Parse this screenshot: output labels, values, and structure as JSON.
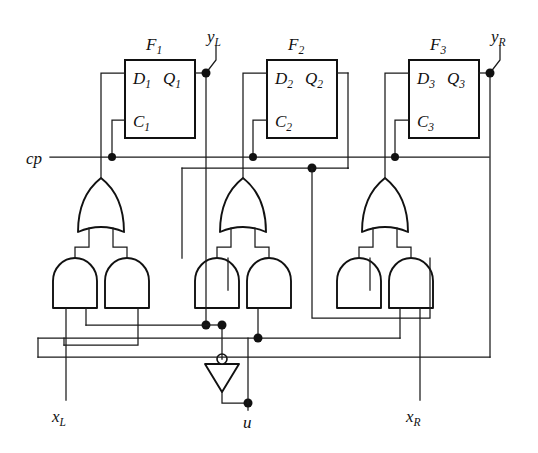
{
  "figure": {
    "type": "logic-circuit-diagram",
    "background_color": "#ffffff",
    "line_color": "#111111"
  },
  "flipflops": [
    {
      "name": "F",
      "index": "1",
      "d_label": "D",
      "d_index": "1",
      "q_label": "Q",
      "q_index": "1",
      "c_label": "C",
      "c_index": "1",
      "x": 125,
      "y": 60,
      "w": 70,
      "h": 78
    },
    {
      "name": "F",
      "index": "2",
      "d_label": "D",
      "d_index": "2",
      "q_label": "Q",
      "q_index": "2",
      "c_label": "C",
      "c_index": "2",
      "x": 267,
      "y": 60,
      "w": 70,
      "h": 78
    },
    {
      "name": "F",
      "index": "3",
      "d_label": "D",
      "d_index": "3",
      "q_label": "Q",
      "q_index": "3",
      "c_label": "C",
      "c_index": "3",
      "x": 409,
      "y": 60,
      "w": 70,
      "h": 78
    }
  ],
  "signals": {
    "clock": {
      "label": "cp",
      "x": 30,
      "y": 163
    },
    "y_left": {
      "label": "y",
      "sub": "L",
      "x": 212,
      "y": 40
    },
    "y_right": {
      "label": "y",
      "sub": "R",
      "x": 496,
      "y": 40
    },
    "x_left": {
      "label": "x",
      "sub": "L",
      "x": 56,
      "y": 418
    },
    "x_right": {
      "label": "x",
      "sub": "R",
      "x": 400,
      "y": 418
    },
    "u_control": {
      "label": "u",
      "x": 244,
      "y": 424
    }
  },
  "gates": {
    "or_gates": [
      {
        "name": "or-gate-1",
        "cx": 101,
        "top_y": 180,
        "bottom_y": 232
      },
      {
        "name": "or-gate-2",
        "cx": 243,
        "top_y": 180,
        "bottom_y": 232
      },
      {
        "name": "or-gate-3",
        "cx": 385,
        "top_y": 180,
        "bottom_y": 232
      }
    ],
    "and_gates": [
      {
        "name": "and-gate-1a",
        "cx": 75,
        "top_y": 258,
        "bottom_y": 308
      },
      {
        "name": "and-gate-1b",
        "cx": 127,
        "top_y": 258,
        "bottom_y": 308
      },
      {
        "name": "and-gate-2a",
        "cx": 217,
        "top_y": 258,
        "bottom_y": 308
      },
      {
        "name": "and-gate-2b",
        "cx": 269,
        "top_y": 258,
        "bottom_y": 308
      },
      {
        "name": "and-gate-3a",
        "cx": 359,
        "top_y": 258,
        "bottom_y": 308
      },
      {
        "name": "and-gate-3b",
        "cx": 411,
        "top_y": 258,
        "bottom_y": 308
      }
    ],
    "inverter": {
      "name": "inverter-u",
      "cx": 222,
      "top_y": 358,
      "bottom_y": 392
    }
  },
  "buses": {
    "clock_bus_y": 157,
    "ubar_bus_y": 325,
    "u_bus_y": 338,
    "feedback_bus_y": 357
  }
}
